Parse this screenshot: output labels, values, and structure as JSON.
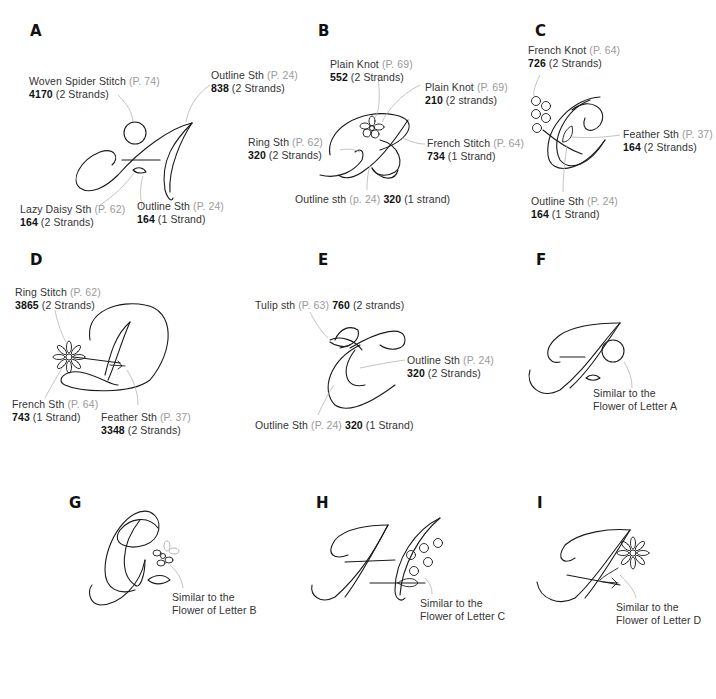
{
  "panels": [
    {
      "letter": "A",
      "annotations": [
        {
          "stitch": "Woven Spider Stitch",
          "page": "(P. 74)",
          "number": "4170",
          "strands": "(2 Strands)"
        },
        {
          "stitch": "Outline Sth",
          "page": "(P. 24)",
          "number": "838",
          "strands": "(2 Strands)"
        },
        {
          "stitch": "Lazy Daisy Sth",
          "page": "(P. 62)",
          "number": "164",
          "strands": "(2 Strands)"
        },
        {
          "stitch": "Outline Sth",
          "page": "(P. 24)",
          "number": "164",
          "strands": "(1 Strand)"
        }
      ]
    },
    {
      "letter": "B",
      "annotations": [
        {
          "stitch": "Plain Knot",
          "page": "(P. 69)",
          "number": "552",
          "strands": "(2 Strands)"
        },
        {
          "stitch": "Plain Knot",
          "page": "(P. 69)",
          "number": "210",
          "strands": "(2 strands)"
        },
        {
          "stitch": "Ring Sth",
          "page": "(P. 62)",
          "number": "320",
          "strands": "(2 Strands)"
        },
        {
          "stitch": "French Stitch",
          "page": "(P. 64)",
          "number": "734",
          "strands": "(1 Strand)"
        },
        {
          "stitch": "Outline sth",
          "page": "(p. 24)",
          "number": "320",
          "strands": "(1 strand)"
        }
      ]
    },
    {
      "letter": "C",
      "annotations": [
        {
          "stitch": "French Knot",
          "page": "(P. 64)",
          "number": "726",
          "strands": "(2 Strands)"
        },
        {
          "stitch": "Feather Sth",
          "page": "(P. 37)",
          "number": "164",
          "strands": "(2 Strands)"
        },
        {
          "stitch": "Outline Sth",
          "page": "(P. 24)",
          "number": "164",
          "strands": "(1 Strand)"
        }
      ]
    },
    {
      "letter": "D",
      "annotations": [
        {
          "stitch": "Ring Stitch",
          "page": "(P. 62)",
          "number": "3865",
          "strands": "(2 Strands)"
        },
        {
          "stitch": "French Sth",
          "page": "(P. 64)",
          "number": "743",
          "strands": "(1 Strand)"
        },
        {
          "stitch": "Feather Sth",
          "page": "(P. 37)",
          "number": "3348",
          "strands": "(2 Strands)"
        }
      ]
    },
    {
      "letter": "E",
      "annotations": [
        {
          "stitch": "Tulip sth",
          "page": "(P. 63)",
          "number": "760",
          "strands": "(2 strands)"
        },
        {
          "stitch": "Outline Sth",
          "page": "(P. 24)",
          "number": "320",
          "strands": "(2 Strands)"
        },
        {
          "stitch": "Outline Sth",
          "page": "(P. 24)",
          "number": "320",
          "strands": "(1 Strand)"
        }
      ]
    },
    {
      "letter": "F",
      "note": {
        "line1": "Similar to the",
        "line2": "Flower of Letter A"
      }
    },
    {
      "letter": "G",
      "note": {
        "line1": "Similar to the",
        "line2": "Flower of Letter B"
      }
    },
    {
      "letter": "H",
      "note": {
        "line1": "Similar to the",
        "line2": "Flower of Letter C"
      }
    },
    {
      "letter": "I",
      "note": {
        "line1": "Similar to the",
        "line2": "Flower of Letter D"
      }
    }
  ]
}
